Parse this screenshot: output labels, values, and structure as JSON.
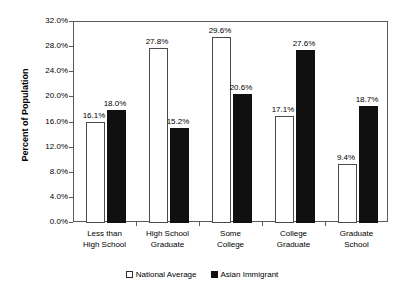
{
  "chart_data": {
    "type": "bar",
    "title": "",
    "subtitle": "",
    "xlabel": "",
    "ylabel": "Percent of Population",
    "ylim": [
      0,
      32
    ],
    "ytick_step": 4,
    "ytick_labels": [
      "0.0%",
      "4.0%",
      "8.0%",
      "12.0%",
      "16.0%",
      "20.0%",
      "24.0%",
      "28.0%",
      "32.0%"
    ],
    "ytick_values": [
      0,
      4,
      8,
      12,
      16,
      20,
      24,
      28,
      32
    ],
    "grid": false,
    "legend_position": "bottom",
    "categories": [
      "Less than High School",
      "High School Graduate",
      "Some College",
      "College Graduate",
      "Graduate School"
    ],
    "category_label_lines": [
      [
        "Less than",
        "High School"
      ],
      [
        "High School",
        "Graduate"
      ],
      [
        "Some",
        "College"
      ],
      [
        "College",
        "Graduate"
      ],
      [
        "Graduate",
        "School"
      ]
    ],
    "series": [
      {
        "name": "National Average",
        "color": "#ffffff",
        "border_color": "#4a4a4a",
        "values": [
          16.1,
          27.8,
          29.6,
          17.1,
          9.4
        ],
        "value_labels": [
          "16.1%",
          "27.8%",
          "29.6%",
          "17.1%",
          "9.4%"
        ]
      },
      {
        "name": "Asian Immigrant",
        "color": "#101010",
        "border_color": "#101010",
        "values": [
          18.0,
          15.2,
          20.6,
          27.6,
          18.7
        ],
        "value_labels": [
          "18.0%",
          "15.2%",
          "20.6%",
          "27.6%",
          "18.7%"
        ]
      }
    ]
  },
  "legend": {
    "entries": [
      {
        "label": "National Average",
        "swatch": "hollow-square-swatch"
      },
      {
        "label": "Asian Immigrant",
        "swatch": "filled-square-swatch"
      }
    ]
  },
  "colors": {
    "axis": "#5a5a5a",
    "text": "#000000",
    "background": "#ffffff",
    "national_average": "#ffffff",
    "asian_immigrant": "#101010"
  }
}
